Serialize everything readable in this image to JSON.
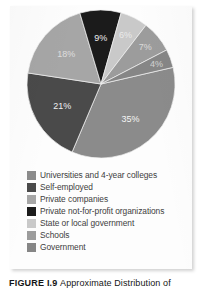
{
  "figure": {
    "caption_label": "FIGURE  I.9",
    "caption_text": "Approximate Distribution of"
  },
  "chart_data": {
    "type": "pie",
    "title": "",
    "subtitle": "",
    "xlabel": "",
    "ylabel": "",
    "legend_position": "bottom-left",
    "grid": false,
    "start_angle_deg": -13,
    "direction": "clockwise",
    "categories": [
      "Universities and 4-year colleges",
      "Self-employed",
      "Private companies",
      "Private not-for-profit organizations",
      "State or local government",
      "Schools",
      "Government"
    ],
    "values": [
      35,
      21,
      18,
      9,
      6,
      7,
      4
    ],
    "value_labels": [
      "35%",
      "21%",
      "18%",
      "9%",
      "6%",
      "7%",
      "4%"
    ],
    "colors": [
      "#8b8b8b",
      "#4a4a4a",
      "#a6a6a6",
      "#1b1b1b",
      "#c9c9c9",
      "#9c9c9c",
      "#868686"
    ],
    "units": "percent"
  },
  "legend": {
    "items": [
      {
        "label": "Universities and 4-year colleges",
        "color": "#8b8b8b",
        "value_label": "35%"
      },
      {
        "label": "Self-employed",
        "color": "#4a4a4a",
        "value_label": "21%"
      },
      {
        "label": "Private companies",
        "color": "#a6a6a6",
        "value_label": "18%"
      },
      {
        "label": "Private not-for-profit organizations",
        "color": "#1b1b1b",
        "value_label": "9%"
      },
      {
        "label": "State or local government",
        "color": "#c9c9c9",
        "value_label": "6%"
      },
      {
        "label": "Schools",
        "color": "#9c9c9c",
        "value_label": "7%"
      },
      {
        "label": "Government",
        "color": "#868686",
        "value_label": "4%"
      }
    ]
  }
}
